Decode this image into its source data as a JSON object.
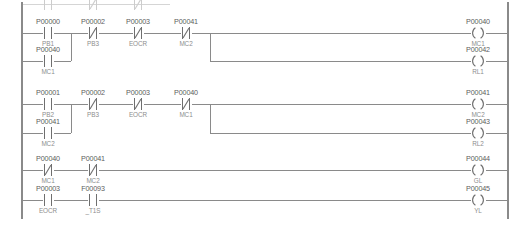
{
  "diagram": {
    "type": "ladder-logic",
    "title": "",
    "rails": {
      "left_x": 22,
      "right_x": 508,
      "top_y": 12,
      "bottom_y": 219
    },
    "colors": {
      "wire": "#8a8a8a",
      "symbol_line": "#6f6f6f",
      "address_text": "#5d5d5d",
      "symbol_text": "#8e8e8e",
      "background": "#ffffff"
    },
    "columns_x": [
      48,
      93,
      138,
      186,
      478
    ],
    "rungs": [
      {
        "id": "rung-1",
        "y": 33,
        "contacts": [
          {
            "address": "P00000",
            "symbol": "PB1",
            "type": "NO",
            "x": 48
          },
          {
            "address": "P00002",
            "symbol": "PB3",
            "type": "NC",
            "x": 93
          },
          {
            "address": "P00003",
            "symbol": "EOCR",
            "type": "NC",
            "x": 138
          },
          {
            "address": "P00041",
            "symbol": "MC2",
            "type": "NC",
            "x": 186
          }
        ],
        "branch": {
          "y": 61,
          "join_x": 71,
          "contacts": [
            {
              "address": "P00040",
              "symbol": "MC1",
              "type": "NO",
              "x": 48
            }
          ]
        },
        "outputs": [
          {
            "address": "P00040",
            "symbol": "MC1",
            "type": "COIL",
            "x": 478,
            "y": 33
          },
          {
            "address": "P00042",
            "symbol": "RL1",
            "type": "COIL",
            "x": 478,
            "y": 61
          }
        ],
        "output_split_x": 210
      },
      {
        "id": "rung-2",
        "y": 104,
        "contacts": [
          {
            "address": "P00001",
            "symbol": "PB2",
            "type": "NO",
            "x": 48
          },
          {
            "address": "P00002",
            "symbol": "PB3",
            "type": "NC",
            "x": 93
          },
          {
            "address": "P00003",
            "symbol": "EOCR",
            "type": "NC",
            "x": 138
          },
          {
            "address": "P00040",
            "symbol": "MC1",
            "type": "NC",
            "x": 186
          }
        ],
        "branch": {
          "y": 133,
          "join_x": 71,
          "contacts": [
            {
              "address": "P00041",
              "symbol": "MC2",
              "type": "NO",
              "x": 48
            }
          ]
        },
        "outputs": [
          {
            "address": "P00041",
            "symbol": "MC2",
            "type": "COIL",
            "x": 478,
            "y": 104
          },
          {
            "address": "P00043",
            "symbol": "RL2",
            "type": "COIL",
            "x": 478,
            "y": 133
          }
        ],
        "output_split_x": 210
      },
      {
        "id": "rung-3",
        "y": 170,
        "contacts": [
          {
            "address": "P00040",
            "symbol": "MC1",
            "type": "NC",
            "x": 48
          },
          {
            "address": "P00041",
            "symbol": "MC2",
            "type": "NC",
            "x": 93
          }
        ],
        "branch": null,
        "outputs": [
          {
            "address": "P00044",
            "symbol": "GL",
            "type": "COIL",
            "x": 478,
            "y": 170
          }
        ],
        "output_split_x": null
      },
      {
        "id": "rung-4",
        "y": 200,
        "contacts": [
          {
            "address": "P00003",
            "symbol": "EOCR",
            "type": "NO",
            "x": 48
          },
          {
            "address": "F00093",
            "symbol": "_T1S",
            "type": "NO",
            "x": 93
          }
        ],
        "branch": null,
        "outputs": [
          {
            "address": "P00045",
            "symbol": "YL",
            "type": "COIL",
            "x": 478,
            "y": 200
          }
        ],
        "output_split_x": null
      }
    ],
    "partial_row_top": {
      "present": true,
      "y": 4,
      "contacts": [
        {
          "x": 48,
          "type": "NO"
        },
        {
          "x": 93,
          "type": "NC"
        },
        {
          "x": 138,
          "type": "NC"
        }
      ]
    }
  }
}
